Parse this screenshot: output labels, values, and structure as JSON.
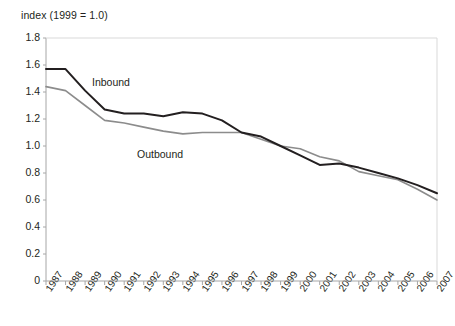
{
  "chart_data": {
    "type": "line",
    "title": "index (1999 = 1.0)",
    "xlabel": "",
    "ylabel": "index (1999 = 1.0)",
    "ylim": [
      0,
      1.8
    ],
    "ytick_step": 0.2,
    "yticks": [
      "1.8",
      "1.6",
      "1.4",
      "1.2",
      "1.0",
      "0.8",
      "0.6",
      "0.4",
      "0.2",
      "0"
    ],
    "ytick_values": [
      1.8,
      1.6,
      1.4,
      1.2,
      1.0,
      0.8,
      0.6,
      0.4,
      0.2,
      0
    ],
    "grid": false,
    "legend_position": "inline-annotation",
    "categories": [
      "1987",
      "1988",
      "1989",
      "1990",
      "1991",
      "1992",
      "1993",
      "1994",
      "1995",
      "1996",
      "1997",
      "1998",
      "1999",
      "2000",
      "2001",
      "2002",
      "2003",
      "2004",
      "2005",
      "2006",
      "2007"
    ],
    "x": [
      1987,
      1988,
      1989,
      1990,
      1991,
      1992,
      1993,
      1994,
      1995,
      1996,
      1997,
      1998,
      1999,
      2000,
      2001,
      2002,
      2003,
      2004,
      2005,
      2006,
      2007
    ],
    "series": [
      {
        "name": "Inbound",
        "color": "#231f20",
        "values": [
          1.57,
          1.57,
          1.41,
          1.27,
          1.24,
          1.24,
          1.22,
          1.25,
          1.24,
          1.19,
          1.1,
          1.07,
          1.0,
          0.93,
          0.86,
          0.87,
          0.84,
          0.8,
          0.76,
          0.71,
          0.65
        ]
      },
      {
        "name": "Outbound",
        "color": "#8c8c8c",
        "values": [
          1.44,
          1.41,
          1.3,
          1.19,
          1.17,
          1.14,
          1.11,
          1.09,
          1.1,
          1.1,
          1.1,
          1.05,
          1.0,
          0.98,
          0.92,
          0.89,
          0.81,
          0.78,
          0.75,
          0.68,
          0.6
        ]
      }
    ],
    "annotations": [
      {
        "text": "Inbound",
        "x_px": 92,
        "y_px": 76
      },
      {
        "text": "Outbound",
        "x_px": 137,
        "y_px": 148
      }
    ]
  },
  "axes": {
    "title": "index (1999 = 1.0)"
  },
  "colors": {
    "inbound": "#231f20",
    "outbound": "#8c8c8c",
    "axis": "#a6a6a6",
    "text": "#231f20"
  }
}
